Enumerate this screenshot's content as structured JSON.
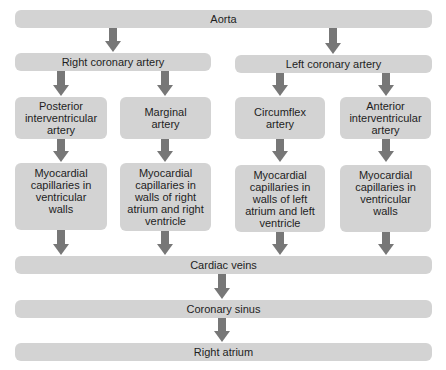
{
  "diagram": {
    "title": "",
    "nodes": {
      "aorta": "Aorta",
      "right_coronary": "Right coronary artery",
      "left_coronary": "Left coronary artery",
      "posterior_iv": "Posterior\ninterventricular\nartery",
      "marginal": "Marginal\nartery",
      "circumflex": "Circumflex\nartery",
      "anterior_iv": "Anterior\ninterventricular\nartery",
      "cap_1": "Myocardial\ncapillaries in\nventricular\nwalls",
      "cap_2": "Myocardial\ncapillaries in\nwalls of right\natrium and right\nventricle",
      "cap_3": "Myocardial\ncapillaries in\nwalls of left\natrium and left\nventricle",
      "cap_4": "Myocardial\ncapillaries in\nventricular\nwalls",
      "cardiac_veins": "Cardiac veins",
      "coronary_sinus": "Coronary sinus",
      "right_atrium": "Right atrium"
    },
    "edges": [
      [
        "Aorta",
        "Right coronary artery"
      ],
      [
        "Aorta",
        "Left coronary artery"
      ],
      [
        "Right coronary artery",
        "Posterior interventricular artery"
      ],
      [
        "Right coronary artery",
        "Marginal artery"
      ],
      [
        "Left coronary artery",
        "Circumflex artery"
      ],
      [
        "Left coronary artery",
        "Anterior interventricular artery"
      ],
      [
        "Posterior interventricular artery",
        "Myocardial capillaries in ventricular walls"
      ],
      [
        "Marginal artery",
        "Myocardial capillaries in walls of right atrium and right ventricle"
      ],
      [
        "Circumflex artery",
        "Myocardial capillaries in walls of left atrium and left ventricle"
      ],
      [
        "Anterior interventricular artery",
        "Myocardial capillaries in ventricular walls"
      ],
      [
        "Myocardial capillaries (all)",
        "Cardiac veins"
      ],
      [
        "Cardiac veins",
        "Coronary sinus"
      ],
      [
        "Coronary sinus",
        "Right atrium"
      ]
    ],
    "colors": {
      "box": "#d3d3d3",
      "arrow": "#777777",
      "text": "#1e1e1e"
    }
  }
}
